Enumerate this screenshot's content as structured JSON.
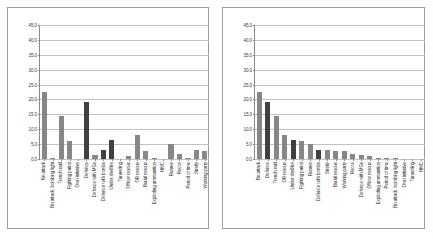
{
  "chart_data": [
    {
      "type": "bar",
      "title": "",
      "xlabel": "",
      "ylabel": "",
      "ylim": [
        0,
        45
      ],
      "ytick_labels": [
        "45.0",
        "40.0",
        "35.0",
        "30.0",
        "25.0",
        "20.0",
        "15.0",
        "10.0",
        "5.0",
        "0.0"
      ],
      "ytick_values": [
        45,
        40,
        35,
        30,
        25,
        20,
        15,
        10,
        5,
        0
      ],
      "grid": true,
      "legend": "none",
      "sorted": false,
      "categories": [
        "Bn attack",
        "Bn attack, bombing light",
        "Trench raid",
        "Fighting patrol",
        "Own initiative",
        "Defence",
        "Defence with MGs",
        "Defence with bombs",
        "Under shellfire",
        "Tunnelling",
        "Officer rescue",
        "OR rescue",
        "Burial rescue",
        "Exploding ammunition",
        "HMC",
        "Runner",
        "Recce",
        "Period of time",
        "Stretly",
        "Working party"
      ],
      "values": [
        22.4,
        0.3,
        14.5,
        6.0,
        0.0,
        19.3,
        1.2,
        3.0,
        6.5,
        0.0,
        1.1,
        7.9,
        2.6,
        0.4,
        0.0,
        5.2,
        1.6,
        0.4,
        3.0,
        2.7
      ],
      "bar_shades": [
        "mid",
        "mid",
        "mid",
        "mid",
        "mid",
        "dark",
        "mid",
        "dark",
        "dark",
        "mid",
        "mid",
        "mid",
        "mid",
        "mid",
        "mid",
        "mid",
        "mid",
        "mid",
        "mid",
        "mid"
      ]
    },
    {
      "type": "bar",
      "title": "",
      "xlabel": "",
      "ylabel": "",
      "ylim": [
        0,
        45
      ],
      "ytick_labels": [
        "45.0",
        "40.0",
        "35.0",
        "30.0",
        "25.0",
        "20.0",
        "15.0",
        "10.0",
        "5.0",
        "0.0"
      ],
      "ytick_values": [
        45,
        40,
        35,
        30,
        25,
        20,
        15,
        10,
        5,
        0
      ],
      "grid": true,
      "legend": "none",
      "sorted": true,
      "categories": [
        "Bn attack",
        "Defence",
        "Trench raid",
        "OR rescue",
        "Under shellfire",
        "Fighting patrol",
        "Runner",
        "Defence with bombs",
        "Stretly",
        "Burial rescue",
        "Working party",
        "Recce",
        "Defence with MGs",
        "Officer rescue",
        "Exploding ammunition",
        "Period of time",
        "Bn attack, bombing light",
        "Own initiative",
        "Tunnelling",
        "HMC"
      ],
      "values": [
        22.4,
        19.3,
        14.5,
        7.9,
        6.5,
        6.0,
        5.2,
        3.0,
        3.0,
        2.6,
        2.7,
        1.6,
        1.2,
        1.1,
        0.4,
        0.4,
        0.3,
        0.0,
        0.0,
        0.0
      ],
      "bar_shades": [
        "mid",
        "dark",
        "mid",
        "mid",
        "dark",
        "mid",
        "mid",
        "dark",
        "mid",
        "mid",
        "mid",
        "mid",
        "mid",
        "mid",
        "mid",
        "mid",
        "mid",
        "mid",
        "mid",
        "mid"
      ]
    }
  ],
  "colors": {
    "bar_mid": "#878787",
    "bar_dark": "#404040",
    "gridline": "#c2c2c2",
    "axis": "#6e6e6e",
    "frame": "#9c9c9c",
    "text": "#2e2e2e",
    "background": "#ffffff"
  }
}
